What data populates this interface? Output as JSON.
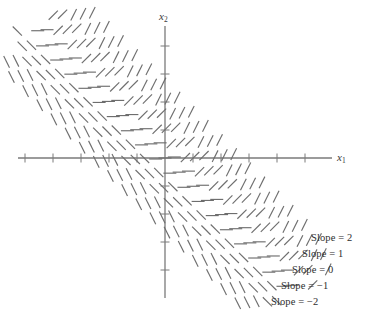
{
  "figure": {
    "kind": "slope-field-diagram",
    "background_color": "#ffffff",
    "stroke_color": "#6e6e6e",
    "axis_color": "#7a7a7a",
    "text_color": "#2e2e2e"
  },
  "axes": {
    "x_axis": {
      "label": "x",
      "label_sub": "1",
      "y_pixel": 158,
      "x_start_pixel": 18,
      "x_end_pixel": 332,
      "tick_spacing_pixel": 28,
      "tick_length_pixel": 9,
      "tick_positions_pixel": [
        25,
        53,
        81,
        109,
        137,
        193,
        221,
        249,
        277,
        305
      ]
    },
    "y_axis": {
      "label": "x",
      "label_sub": "2",
      "x_pixel": 165,
      "y_start_pixel": 26,
      "y_end_pixel": 298,
      "tick_spacing_pixel": 28,
      "tick_length_pixel": 9,
      "tick_positions_pixel": [
        46,
        74,
        102,
        130,
        186,
        214,
        242,
        270
      ]
    },
    "origin_pixel": [
      165,
      158
    ]
  },
  "chart_data": {
    "type": "scatter",
    "title": "",
    "xlabel": "x1",
    "ylabel": "x2",
    "grid": false,
    "legend_position": "bottom-right-inline",
    "axis_ranges": {
      "x_pixel": [
        18,
        332
      ],
      "y_pixel": [
        26,
        298
      ]
    },
    "bands": [
      {
        "name": "Slope = 2",
        "slope": 2,
        "label": "Slope = 2",
        "band_index": 0,
        "offset_perp_pixel": -44,
        "segment_count": 18
      },
      {
        "name": "Slope = 1",
        "slope": 1,
        "label": "Slope = 1",
        "band_index": 1,
        "offset_perp_pixel": -22,
        "segment_count": 18
      },
      {
        "name": "Slope = 0",
        "slope": 0,
        "label": "Slope = 0",
        "band_index": 2,
        "offset_perp_pixel": 0,
        "segment_count": 18
      },
      {
        "name": "Slope = -1",
        "slope": -1,
        "label": "Slope = −1",
        "band_index": 3,
        "offset_perp_pixel": 22,
        "segment_count": 18
      },
      {
        "name": "Slope = -2",
        "slope": -2,
        "label": "Slope = −2",
        "band_index": 4,
        "offset_perp_pixel": 44,
        "segment_count": 18
      }
    ],
    "band_direction_pixel": [
      1,
      1
    ],
    "segment_length_pixel": 13,
    "segment_spacing_pixel": 20
  },
  "slope_labels": [
    {
      "text": "Slope = 2",
      "left": 311,
      "top": 233
    },
    {
      "text": "Slope = 1",
      "left": 302,
      "top": 249
    },
    {
      "text": "Slope = 0",
      "left": 292,
      "top": 265
    },
    {
      "text": "Slope = −1",
      "left": 281,
      "top": 281
    },
    {
      "text": "Slope = −2",
      "left": 271,
      "top": 297
    }
  ]
}
